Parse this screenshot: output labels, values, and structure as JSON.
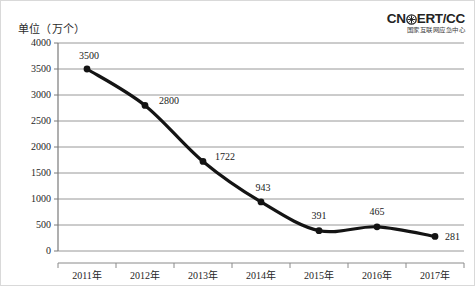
{
  "figure": {
    "unit_label": "单位（万个）",
    "background_color": "#ffffff",
    "border_color": "#d9d9d9"
  },
  "logo": {
    "name": "CNCERT/CC",
    "text_before_mark": "CN",
    "mark_icon": "cncert-globe-icon",
    "text_after_mark": "ERT",
    "slash": "/",
    "text_tail": "CC",
    "subtitle": "国家互联网应急中心",
    "color": "#232323"
  },
  "chart_data": {
    "type": "line",
    "title": "",
    "subtitle": "",
    "xlabel": "",
    "ylabel": "单位（万个）",
    "categories": [
      "2011年",
      "2012年",
      "2013年",
      "2014年",
      "2015年",
      "2016年",
      "2017年"
    ],
    "values": [
      3500,
      2800,
      1722,
      943,
      391,
      465,
      281
    ],
    "point_labels": [
      "3500",
      "2800",
      "1722",
      "943",
      "391",
      "465",
      "281"
    ],
    "ylim": [
      0,
      4000
    ],
    "yticks": [
      0,
      500,
      1000,
      1500,
      2000,
      2500,
      3000,
      3500,
      4000
    ],
    "ytick_labels": [
      "0",
      "500",
      "1000",
      "1500",
      "2000",
      "2500",
      "3000",
      "3500",
      "4000"
    ],
    "grid": true,
    "grid_axis": "y",
    "grid_color": "#8c8c8c",
    "legend": false,
    "legend_position": "none",
    "line_color": "#141414",
    "line_width": 3.2,
    "marker": "circle",
    "marker_color": "#141414",
    "axis_color": "#7a7a7a"
  }
}
